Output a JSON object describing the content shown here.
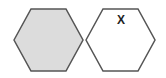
{
  "diagram": {
    "type": "hexagon-pair",
    "colors": {
      "background": "#ffffff",
      "stroke": "#555555",
      "filled": "#dcdcdc",
      "empty": "#ffffff",
      "label": "#222222"
    },
    "cells": [
      {
        "id": "left",
        "state": "filled",
        "points": "14,40 31,9 66,9 83,40 66,71 31,71",
        "label": ""
      },
      {
        "id": "right",
        "state": "empty",
        "points": "86,40 103,9 138,9 155,40 138,71 103,71",
        "label": "X"
      }
    ]
  }
}
